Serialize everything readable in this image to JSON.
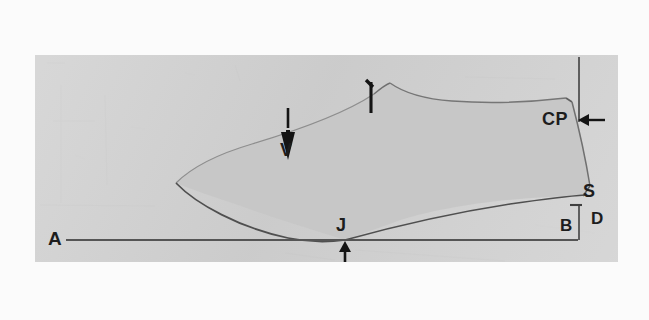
{
  "document": {
    "kind": "photographed hand-drawn technical sketch",
    "subject": "shoe last / boot side profile with measurement annotations"
  },
  "colors": {
    "page_background": "#fbfbfb",
    "photo_background": "#d2d2d2",
    "last_fill": "#c6c6c6",
    "outline_stroke": "#6e6e6e",
    "baseline_stroke": "#555555",
    "label_ink": "#1d1d1d"
  },
  "labels": [
    {
      "id": "A",
      "text": "A",
      "meaning": "ground baseline reference point at left"
    },
    {
      "id": "V",
      "text": "V",
      "meaning": "vamp point marked by down arrow on the upper curve"
    },
    {
      "id": "I",
      "text": "I",
      "meaning": "instep point tick mark at top of the instep curve"
    },
    {
      "id": "CP",
      "text": "CP",
      "meaning": "centre point at the back top corner, marked by left arrow"
    },
    {
      "id": "S",
      "text": "S",
      "meaning": "seat point at lower back of the last"
    },
    {
      "id": "B",
      "text": "B",
      "meaning": "horizontal back measurement span"
    },
    {
      "id": "D",
      "text": "D",
      "meaning": "vertical heel height drop"
    },
    {
      "id": "J",
      "text": "J",
      "meaning": "joint point where the sole curve meets the baseline, marked by up arrow"
    }
  ],
  "annotations": {
    "arrow_v": {
      "direction": "down",
      "label": "V"
    },
    "arrow_i": {
      "direction": "tick",
      "label": "I"
    },
    "arrow_cp": {
      "direction": "left",
      "label": "CP"
    },
    "arrow_j": {
      "direction": "up",
      "label": "J"
    }
  },
  "geometry": {
    "baseline_label": "A baseline",
    "vertical_drop_label": "CP vertical",
    "heel_box_label": "B / D measurement box"
  }
}
